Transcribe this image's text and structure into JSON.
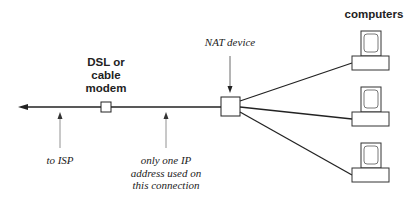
{
  "labels": {
    "computers": "computers",
    "modem": [
      "DSL or",
      "cable",
      "modem"
    ],
    "nat_device": "NAT device",
    "to_isp": "to ISP",
    "one_ip": [
      "only one IP",
      "address used on",
      "this connection"
    ]
  },
  "nodes": {
    "modem": {
      "x": 101,
      "y": 102,
      "w": 10,
      "h": 10
    },
    "nat": {
      "x": 221,
      "y": 97,
      "w": 19,
      "h": 19
    },
    "computers": [
      {
        "monitor_x": 361,
        "monitor_y": 31,
        "base_x": 352,
        "base_y": 56
      },
      {
        "monitor_x": 361,
        "monitor_y": 87,
        "base_x": 352,
        "base_y": 112
      },
      {
        "monitor_x": 361,
        "monitor_y": 143,
        "base_x": 352,
        "base_y": 168
      }
    ]
  },
  "colors": {
    "line": "#222222",
    "pointer": "#777777",
    "text": "#222222"
  }
}
